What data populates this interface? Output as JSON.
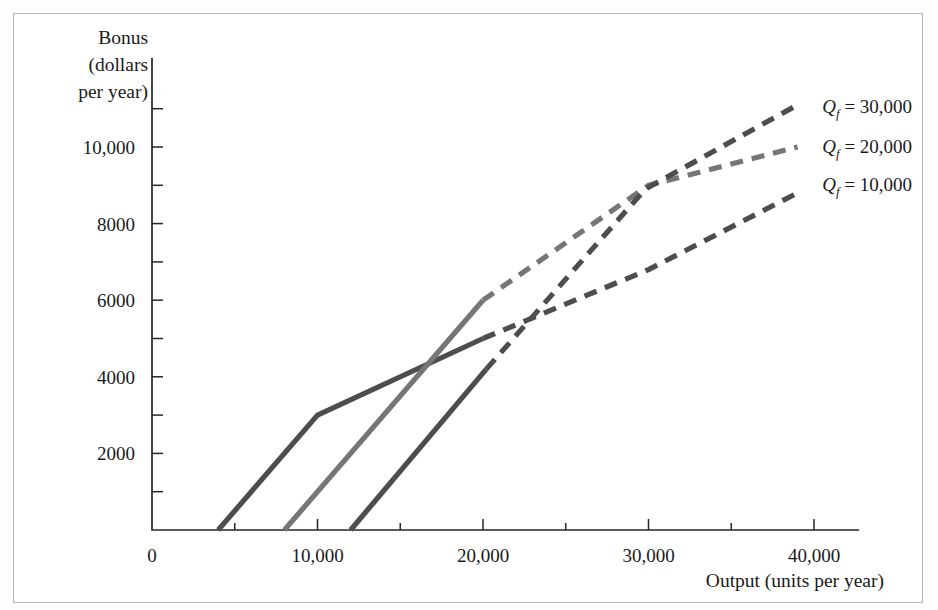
{
  "figure": {
    "background_color": "#ffffff",
    "frame_color": "#b4b4b4",
    "axis_color": "#262626"
  },
  "chart_data": {
    "type": "line",
    "title": "",
    "subtitle": "",
    "xlabel": "Output (units per year)",
    "ylabel": "Bonus (dollars per year)",
    "ylabel_lines": [
      "Bonus",
      "(dollars",
      "per year)"
    ],
    "xlim": [
      0,
      42000
    ],
    "ylim": [
      0,
      11600
    ],
    "grid": false,
    "legend_position": "right-inline",
    "x_ticks": [
      0,
      10000,
      20000,
      30000,
      40000
    ],
    "x_tick_labels": [
      "0",
      "10,000",
      "20,000",
      "30,000",
      "40,000"
    ],
    "x_minor_ticks": [
      5000,
      15000,
      25000,
      35000
    ],
    "y_ticks": [
      2000,
      4000,
      6000,
      8000,
      10000
    ],
    "y_tick_labels": [
      "2000",
      "4000",
      "6000",
      "8000",
      "10,000"
    ],
    "y_minor_ticks": [
      1000,
      3000,
      5000,
      7000,
      9000,
      11000
    ],
    "series": [
      {
        "name": "Qf = 10,000",
        "label_prefix": "Q",
        "label_subscript": "f",
        "label_value": "= 10,000",
        "color": "#4d4d4d",
        "label_x": 40500,
        "label_y": 9000,
        "solid_points": [
          [
            4000,
            0
          ],
          [
            10000,
            3000
          ],
          [
            20000,
            5000
          ]
        ],
        "dashed_points": [
          [
            20000,
            5000
          ],
          [
            30000,
            6800
          ],
          [
            39000,
            8800
          ]
        ]
      },
      {
        "name": "Qf = 20,000",
        "label_prefix": "Q",
        "label_subscript": "f",
        "label_value": "= 20,000",
        "color": "#767676",
        "label_x": 40500,
        "label_y": 10000,
        "solid_points": [
          [
            8000,
            0
          ],
          [
            20000,
            6000
          ]
        ],
        "dashed_points": [
          [
            20000,
            6000
          ],
          [
            30000,
            9000
          ],
          [
            39000,
            10000
          ]
        ]
      },
      {
        "name": "Qf = 30,000",
        "label_prefix": "Q",
        "label_subscript": "f",
        "label_value": "= 30,000",
        "color": "#4d4d4d",
        "label_x": 40500,
        "label_y": 11050,
        "solid_points": [
          [
            12000,
            0
          ],
          [
            20200,
            4200
          ]
        ],
        "dashed_points": [
          [
            20200,
            4200
          ],
          [
            29800,
            8900
          ],
          [
            39000,
            11100
          ]
        ]
      }
    ]
  }
}
